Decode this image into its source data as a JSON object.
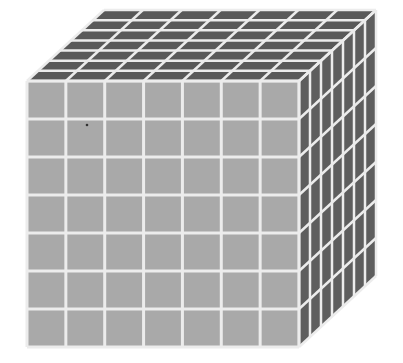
{
  "diagram": {
    "type": "cube-grid",
    "grid_size": 7,
    "colors": {
      "background": "#ffffff",
      "front_face": "#a9a9a9",
      "top_face": "#595959",
      "side_face": "#5e5e5e",
      "grid_lines": "#ececec",
      "speck": "#333333"
    },
    "geometry": {
      "front": {
        "x": 27,
        "y": 81,
        "width": 272,
        "height": 266
      },
      "depth_offset": {
        "dx": 77,
        "dy": -71
      }
    },
    "speck": {
      "x": 87,
      "y": 125
    }
  }
}
